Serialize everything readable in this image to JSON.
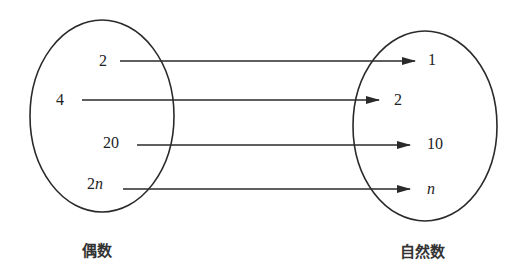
{
  "diagram": {
    "type": "mapping",
    "domain_set": {
      "caption": "偶数",
      "elements": [
        "2",
        "4",
        "20",
        "2n"
      ]
    },
    "codomain_set": {
      "caption": "自然数",
      "elements": [
        "1",
        "2",
        "10",
        "n"
      ]
    },
    "mappings": [
      {
        "from": "2",
        "to": "1"
      },
      {
        "from": "4",
        "to": "2"
      },
      {
        "from": "20",
        "to": "10"
      },
      {
        "from": "2n",
        "to": "n"
      }
    ],
    "colors": {
      "line": "#2a2a2a",
      "background": "#ffffff"
    }
  },
  "labels": {
    "left": {
      "e0": "2",
      "e1": "4",
      "e2": "20",
      "e3_num": "2",
      "e3_var": "n",
      "caption": "偶数"
    },
    "right": {
      "e0": "1",
      "e1": "2",
      "e2": "10",
      "e3": "n",
      "caption": "自然数"
    }
  }
}
